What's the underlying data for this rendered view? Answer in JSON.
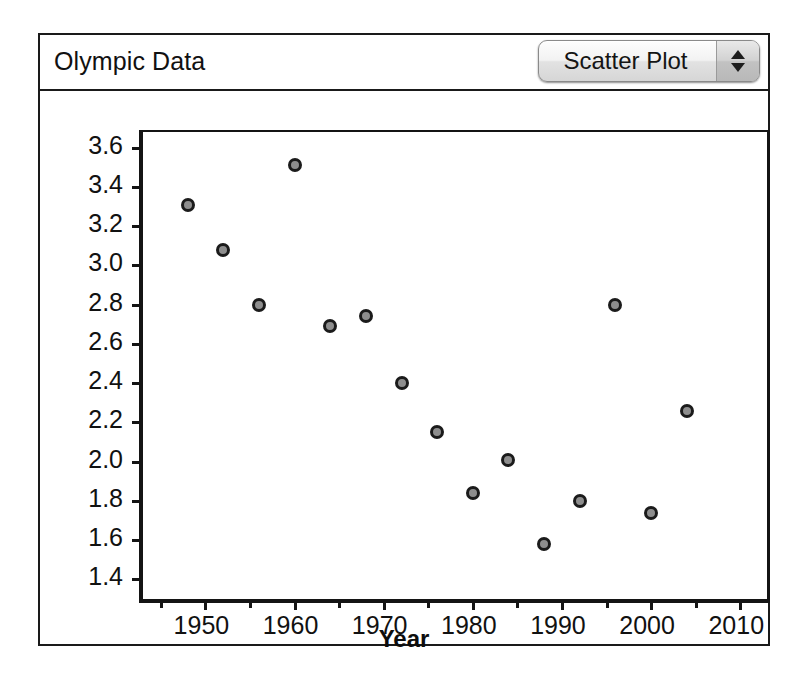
{
  "window": {
    "title": "Olympic Data"
  },
  "plot_type_control": {
    "value": "Scatter Plot",
    "up_arrow": "stepper-up-arrow",
    "down_arrow": "stepper-down-arrow"
  },
  "chart_data": {
    "type": "scatter",
    "title": "Olympic Data",
    "xlabel": "Year",
    "ylabel": "Gap_in_seconds",
    "xlim": [
      1943,
      2013
    ],
    "ylim": [
      1.3,
      3.68
    ],
    "grid": false,
    "legend": null,
    "xticks": [
      1950,
      1960,
      1970,
      1980,
      1990,
      2000,
      2010
    ],
    "xticklabels": [
      "1950",
      "1960",
      "1970",
      "1980",
      "1990",
      "2000",
      "2010"
    ],
    "xminorticks": [
      1945,
      1955,
      1965,
      1975,
      1985,
      1995,
      2005
    ],
    "yticks": [
      1.4,
      1.6,
      1.8,
      2.0,
      2.2,
      2.4,
      2.6,
      2.8,
      3.0,
      3.2,
      3.4,
      3.6
    ],
    "yticklabels": [
      "1.4",
      "1.6",
      "1.8",
      "2.0",
      "2.2",
      "2.4",
      "2.6",
      "2.8",
      "3.0",
      "3.2",
      "3.4",
      "3.6"
    ],
    "x": [
      1948,
      1952,
      1956,
      1960,
      1964,
      1968,
      1972,
      1976,
      1980,
      1984,
      1988,
      1992,
      1996,
      2000,
      2004
    ],
    "y": [
      3.31,
      3.08,
      2.8,
      3.51,
      2.69,
      2.74,
      2.4,
      2.15,
      1.84,
      2.01,
      1.58,
      1.8,
      2.8,
      1.74,
      2.26
    ],
    "marker": {
      "shape": "circle",
      "fill": "#8e8e8e",
      "edge": "#1b1b1b",
      "size": 14
    }
  }
}
